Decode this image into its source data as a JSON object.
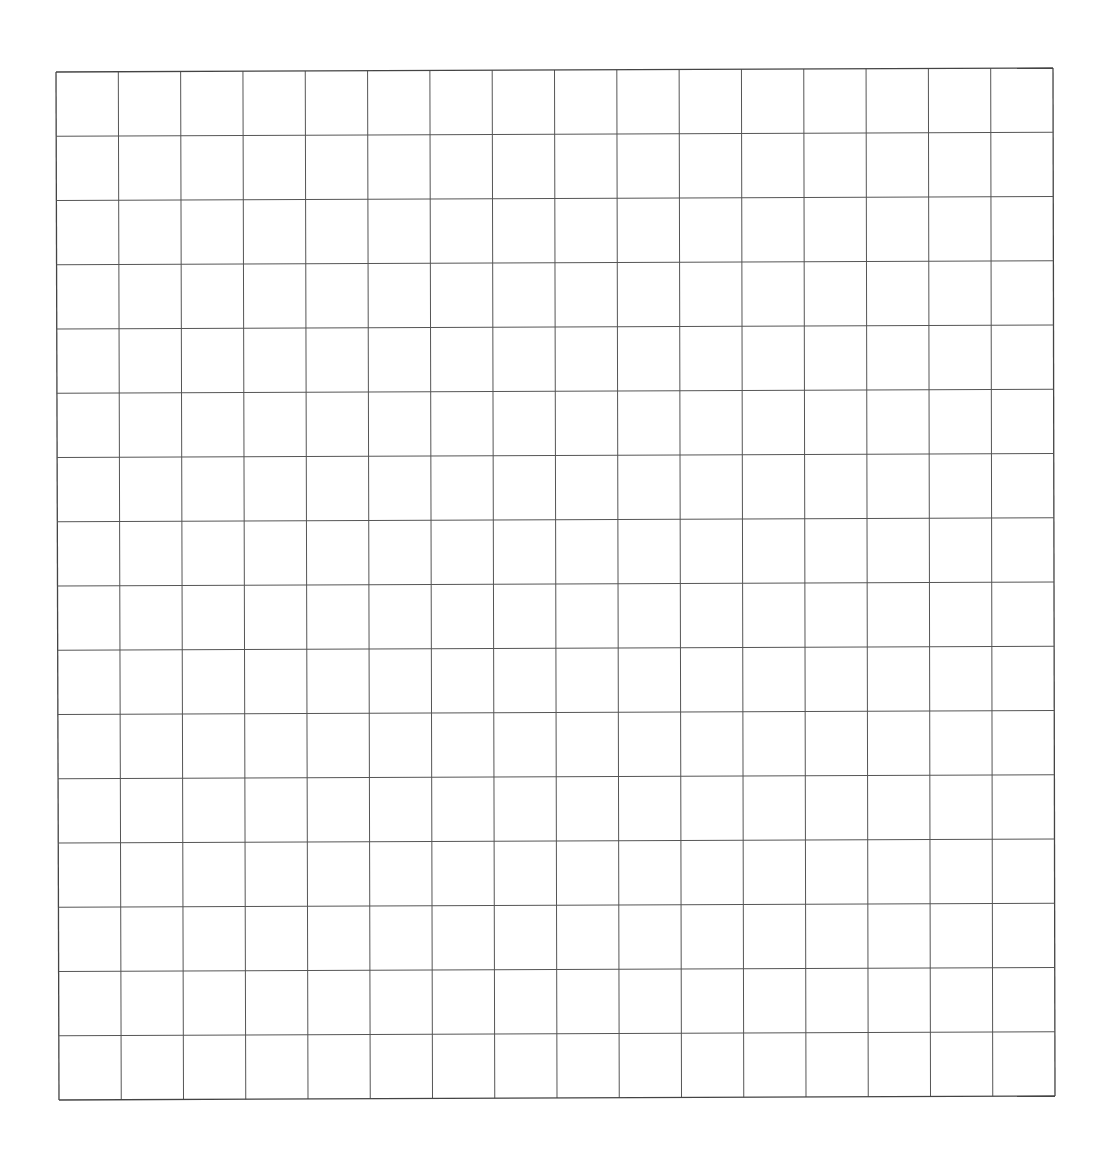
{
  "grid": {
    "rows": 16,
    "cols": 16,
    "corners": {
      "tl": [
        56,
        72
      ],
      "tr": [
        1053,
        68
      ],
      "bl": [
        59,
        1100
      ],
      "br": [
        1055,
        1096
      ]
    },
    "line_color": "#555555",
    "border_color": "#444444",
    "background": "#ffffff"
  }
}
